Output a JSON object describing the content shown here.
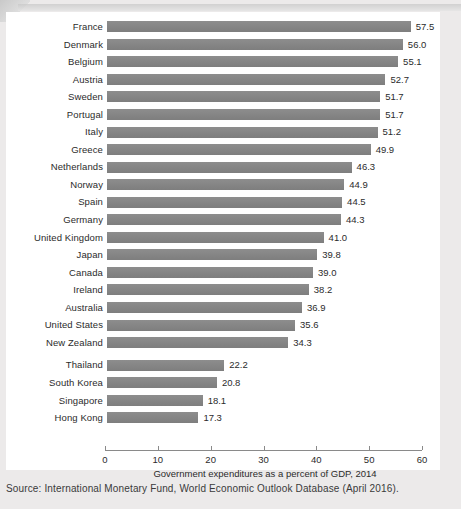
{
  "chart_data": {
    "type": "bar",
    "orientation": "horizontal",
    "title": "",
    "xlabel": "Government expenditures as a percent of GDP, 2014",
    "ylabel": "",
    "xlim": [
      0,
      60
    ],
    "xticks": [
      0,
      10,
      20,
      30,
      40,
      50,
      60
    ],
    "grid": false,
    "legend": null,
    "bar_color": "#848484",
    "categories": [
      "France",
      "Denmark",
      "Belgium",
      "Austria",
      "Sweden",
      "Portugal",
      "Italy",
      "Greece",
      "Netherlands",
      "Norway",
      "Spain",
      "Germany",
      "United Kingdom",
      "Japan",
      "Canada",
      "Ireland",
      "Australia",
      "United States",
      "New Zealand",
      "Thailand",
      "South Korea",
      "Singapore",
      "Hong Kong"
    ],
    "values": [
      57.5,
      56.0,
      55.1,
      52.7,
      51.7,
      51.7,
      51.2,
      49.9,
      46.3,
      44.9,
      44.5,
      44.3,
      41.0,
      39.8,
      39.0,
      38.2,
      36.9,
      35.6,
      34.3,
      22.2,
      20.8,
      18.1,
      17.3
    ],
    "value_labels": [
      "57.5",
      "56.0",
      "55.1",
      "52.7",
      "51.7",
      "51.7",
      "51.2",
      "49.9",
      "46.3",
      "44.9",
      "44.5",
      "44.3",
      "41.0",
      "39.8",
      "39.0",
      "38.2",
      "36.9",
      "35.6",
      "34.3",
      "22.2",
      "20.8",
      "18.1",
      "17.3"
    ],
    "group_break_after_index": 18
  },
  "source": "Source: International Monetary Fund, World Economic Outlook Database (April 2016)."
}
